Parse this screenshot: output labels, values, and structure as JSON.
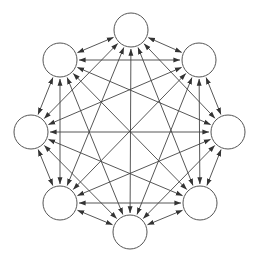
{
  "diagram": {
    "type": "complete-graph",
    "node_count": 8,
    "nodes": [
      {
        "id": "n0",
        "label": "",
        "x": 131,
        "y": 30
      },
      {
        "id": "n1",
        "label": "",
        "x": 199,
        "y": 60
      },
      {
        "id": "n2",
        "label": "",
        "x": 228,
        "y": 132
      },
      {
        "id": "n3",
        "label": "",
        "x": 200,
        "y": 203
      },
      {
        "id": "n4",
        "label": "",
        "x": 130,
        "y": 232
      },
      {
        "id": "n5",
        "label": "",
        "x": 60,
        "y": 203
      },
      {
        "id": "n6",
        "label": "",
        "x": 31,
        "y": 132
      },
      {
        "id": "n7",
        "label": "",
        "x": 60,
        "y": 60
      }
    ],
    "node_radius": 17,
    "edge_style": "bidirectional",
    "colors": {
      "background": "#ffffff",
      "node_fill": "#ffffff",
      "node_stroke": "#555555",
      "edge": "#444444",
      "arrowhead": "#333333"
    }
  }
}
